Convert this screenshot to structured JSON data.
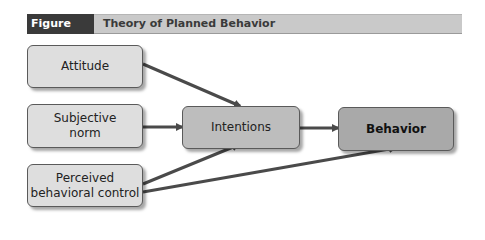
{
  "figure": {
    "label": "Figure 10.2",
    "title": "Theory of Planned Behavior"
  },
  "nodes": {
    "attitude": "Attitude",
    "subjective_norm_line1": "Subjective",
    "subjective_norm_line2": "norm",
    "pbc_line1": "Perceived",
    "pbc_line2": "behavioral control",
    "intentions": "Intentions",
    "behavior": "Behavior"
  },
  "edges": [
    {
      "from": "Attitude",
      "to": "Intentions"
    },
    {
      "from": "Subjective norm",
      "to": "Intentions"
    },
    {
      "from": "Perceived behavioral control",
      "to": "Intentions"
    },
    {
      "from": "Perceived behavioral control",
      "to": "Behavior"
    },
    {
      "from": "Intentions",
      "to": "Behavior"
    }
  ],
  "colors": {
    "header_dark": "#3a3a3a",
    "header_band": "#c9c9c9",
    "arrow": "#4a4a4a"
  }
}
